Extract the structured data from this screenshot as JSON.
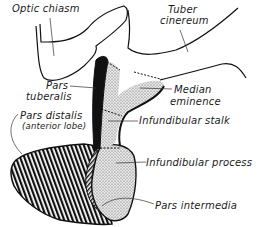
{
  "diagram": {
    "labels": {
      "optic_chiasm": "Optic chiasm",
      "tuber_cinereum_1": "Tuber",
      "tuber_cinereum_2": "cinereum",
      "pars_tuberalis_1": "Pars",
      "pars_tuberalis_2": "tuberalis",
      "median_eminence_1": "Median",
      "median_eminence_2": "eminence",
      "pars_distalis_1": "Pars distalis",
      "pars_distalis_2": "(anterior lobe)",
      "infundibular_stalk": "Infundibular stalk",
      "infundibular_process": "Infundibular process",
      "pars_intermedia": "Pars intermedia"
    },
    "colors": {
      "ink": "#111111",
      "stipple": "#d8d8d8",
      "background": "#ffffff"
    }
  }
}
